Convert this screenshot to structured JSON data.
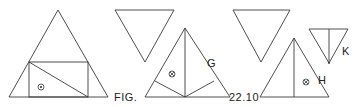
{
  "figure": {
    "caption_left": "FIG.",
    "caption_right": "22.10",
    "labels": {
      "g": "G",
      "h": "H",
      "k": "K"
    },
    "colors": {
      "line": "#3a3a3a",
      "background": "#ffffff"
    },
    "shapes": [
      {
        "id": "large-triangle-with-rectangle",
        "type": "triangle",
        "orientation": "up",
        "note": "inscribed rectangle with diagonal, circled dot symbol"
      },
      {
        "id": "inverted-triangle-1",
        "type": "triangle",
        "orientation": "down"
      },
      {
        "id": "triangle-g",
        "type": "triangle",
        "orientation": "up",
        "note": "median with two lines from base midpoint, circled cross symbol"
      },
      {
        "id": "inverted-triangle-2",
        "type": "triangle",
        "orientation": "down"
      },
      {
        "id": "triangle-h",
        "type": "triangle",
        "orientation": "up",
        "note": "vertical altitude, circled cross symbol"
      },
      {
        "id": "inverted-triangle-k",
        "type": "triangle",
        "orientation": "down",
        "note": "vertical bisector"
      }
    ],
    "symbols": {
      "circled_dot": "⊙",
      "circled_cross": "⊗"
    }
  }
}
